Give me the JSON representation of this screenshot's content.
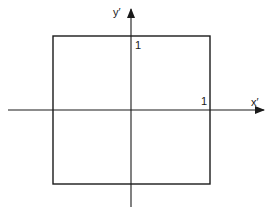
{
  "diagram": {
    "type": "coordinate-system-square",
    "colors": {
      "background": "#ffffff",
      "stroke": "#1a1a1a"
    },
    "axes": {
      "x_label": "x′",
      "y_label": "y′"
    },
    "ticks": {
      "x_tick_label": "1",
      "y_tick_label": "1"
    },
    "square": {
      "description": "Unit square centered at origin with corners at (±1, ±1)",
      "x_range": [
        -1,
        1
      ],
      "y_range": [
        -1,
        1
      ]
    }
  }
}
